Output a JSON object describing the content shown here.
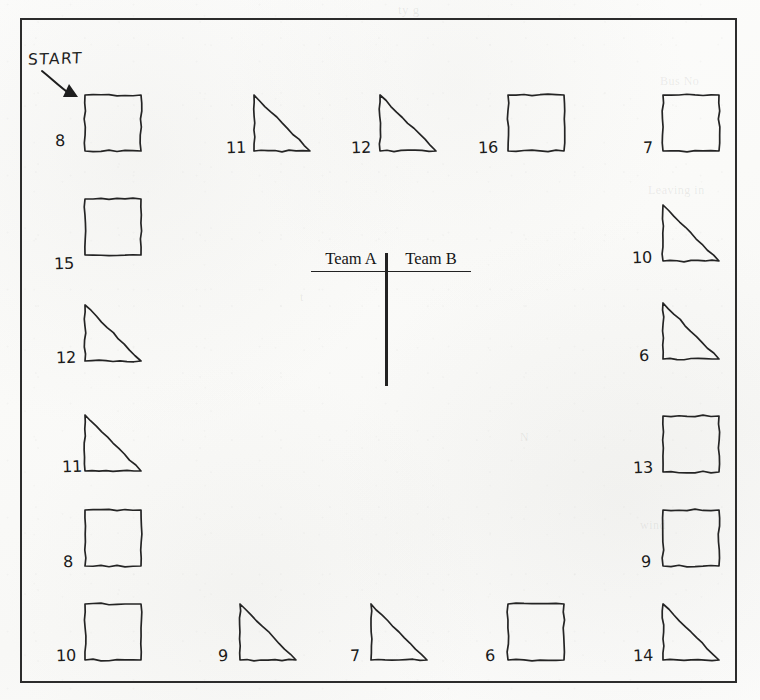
{
  "page": {
    "paper_color": "#fbfbfa",
    "ink_color": "#242424"
  },
  "board": {
    "start_label": "START",
    "start_arrow_icon": "curved-arrow-icon",
    "frame": {
      "x": 20,
      "y": 18,
      "width": 717,
      "height": 665
    },
    "cells": [
      {
        "index": 1,
        "number": "8",
        "shape": "square",
        "side": "top",
        "x": 83,
        "y": 93,
        "size": 56,
        "number_x": 55,
        "number_y": 133
      },
      {
        "index": 2,
        "number": "11",
        "shape": "triangle",
        "side": "top",
        "x": 252,
        "y": 93,
        "size": 56,
        "number_x": 226,
        "number_y": 140
      },
      {
        "index": 3,
        "number": "12",
        "shape": "triangle",
        "side": "top",
        "x": 378,
        "y": 93,
        "size": 56,
        "number_x": 351,
        "number_y": 140
      },
      {
        "index": 4,
        "number": "16",
        "shape": "square",
        "side": "top",
        "x": 506,
        "y": 93,
        "size": 56,
        "number_x": 478,
        "number_y": 140
      },
      {
        "index": 5,
        "number": "7",
        "shape": "square",
        "side": "top",
        "x": 661,
        "y": 93,
        "size": 56,
        "number_x": 643,
        "number_y": 140
      },
      {
        "index": 6,
        "number": "10",
        "shape": "triangle",
        "side": "right",
        "x": 661,
        "y": 203,
        "size": 56,
        "number_x": 632,
        "number_y": 250
      },
      {
        "index": 7,
        "number": "6",
        "shape": "triangle",
        "side": "right",
        "x": 661,
        "y": 301,
        "size": 56,
        "number_x": 639,
        "number_y": 348
      },
      {
        "index": 8,
        "number": "13",
        "shape": "square",
        "side": "right",
        "x": 661,
        "y": 414,
        "size": 56,
        "number_x": 633,
        "number_y": 460
      },
      {
        "index": 9,
        "number": "9",
        "shape": "square",
        "side": "right",
        "x": 661,
        "y": 508,
        "size": 56,
        "number_x": 641,
        "number_y": 554
      },
      {
        "index": 10,
        "number": "14",
        "shape": "triangle",
        "side": "right",
        "x": 661,
        "y": 602,
        "size": 56,
        "number_x": 633,
        "number_y": 648
      },
      {
        "index": 11,
        "number": "6",
        "shape": "square",
        "side": "bottom",
        "x": 506,
        "y": 602,
        "size": 56,
        "number_x": 485,
        "number_y": 648
      },
      {
        "index": 12,
        "number": "7",
        "shape": "triangle",
        "side": "bottom",
        "x": 369,
        "y": 602,
        "size": 56,
        "number_x": 350,
        "number_y": 648
      },
      {
        "index": 13,
        "number": "9",
        "shape": "triangle",
        "side": "bottom",
        "x": 238,
        "y": 602,
        "size": 56,
        "number_x": 218,
        "number_y": 648
      },
      {
        "index": 14,
        "number": "10",
        "shape": "square",
        "side": "bottom",
        "x": 83,
        "y": 602,
        "size": 56,
        "number_x": 56,
        "number_y": 648
      },
      {
        "index": 15,
        "number": "8",
        "shape": "square",
        "side": "left",
        "x": 83,
        "y": 508,
        "size": 56,
        "number_x": 63,
        "number_y": 554
      },
      {
        "index": 16,
        "number": "11",
        "shape": "triangle",
        "side": "left",
        "x": 83,
        "y": 413,
        "size": 56,
        "number_x": 62,
        "number_y": 459
      },
      {
        "index": 17,
        "number": "12",
        "shape": "triangle",
        "side": "left",
        "x": 83,
        "y": 303,
        "size": 56,
        "number_x": 56,
        "number_y": 350
      },
      {
        "index": 18,
        "number": "15",
        "shape": "square",
        "side": "left",
        "x": 83,
        "y": 197,
        "size": 56,
        "number_x": 54,
        "number_y": 256
      }
    ]
  },
  "scoreboard": {
    "team_a_label": "Team A",
    "team_b_label": "Team B"
  },
  "bleed_through": [
    {
      "text": "ty g",
      "x": 398,
      "y": 2,
      "size": 13
    },
    {
      "text": "Bus No",
      "x": 660,
      "y": 74,
      "size": 12
    },
    {
      "text": "Leaving in",
      "x": 648,
      "y": 183,
      "size": 12
    },
    {
      "text": "t",
      "x": 300,
      "y": 290,
      "size": 12
    },
    {
      "text": "N",
      "x": 520,
      "y": 430,
      "size": 12
    },
    {
      "text": "wind",
      "x": 640,
      "y": 518,
      "size": 12
    }
  ]
}
